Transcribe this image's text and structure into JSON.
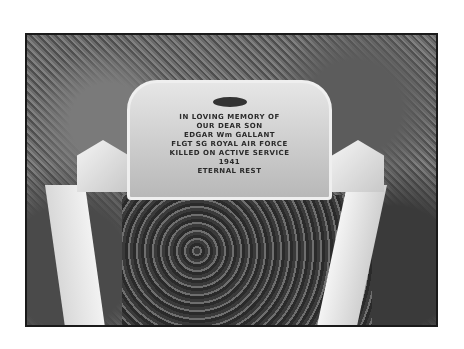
{
  "photo": {
    "subject": "grave headstone with white kerb surround",
    "inscription": [
      "IN LOVING MEMORY OF",
      "OUR DEAR SON",
      "EDGAR Wm GALLANT",
      "FLGT SG ROYAL AIR FORCE",
      "KILLED ON ACTIVE SERVICE",
      "1941",
      "ETERNAL REST"
    ]
  }
}
